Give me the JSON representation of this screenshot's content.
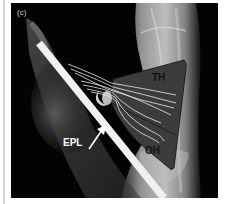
{
  "figure": {
    "panel_label": "(c)",
    "type": "annotated radiograph",
    "labels": {
      "th": "TH",
      "oh": "OH",
      "epl": "EPL"
    },
    "colors": {
      "background": "#000000",
      "muscle_fill": "#3a3a3a",
      "muscle_outline": "#111111",
      "rod": "#f2f2f2",
      "fibers": "#e6e6e6",
      "bone": "#bdbdbd"
    }
  }
}
